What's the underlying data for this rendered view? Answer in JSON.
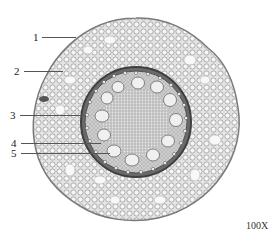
{
  "figure": {
    "magnification": "100X",
    "labels": [
      {
        "text": "1",
        "x": 33,
        "y": 32,
        "line_x1": 42,
        "line_x2": 76,
        "line_y": 37
      },
      {
        "text": "2",
        "x": 14,
        "y": 66,
        "line_x1": 24,
        "line_x2": 63,
        "line_y": 71
      },
      {
        "text": "3",
        "x": 10,
        "y": 110,
        "line_x1": 20,
        "line_x2": 86,
        "line_y": 115
      },
      {
        "text": "4",
        "x": 11,
        "y": 138,
        "line_x1": 21,
        "line_x2": 101,
        "line_y": 143
      },
      {
        "text": "5",
        "x": 11,
        "y": 148,
        "line_x1": 21,
        "line_x2": 110,
        "line_y": 153
      }
    ],
    "colors": {
      "background": "#ffffff",
      "cortex_fill": "#d9d9d9",
      "cell_wall": "#8a8a8a",
      "endodermis": "#4a4a4a",
      "vessel_fill": "#eeeeee",
      "pith": "#cfcfcf"
    }
  }
}
